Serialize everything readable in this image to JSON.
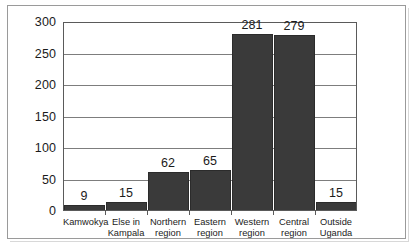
{
  "chart_data": {
    "type": "bar",
    "title": "",
    "subtitle": "",
    "xlabel": "",
    "ylabel": "",
    "categories": [
      "Kamwokya",
      "Else in\nKampala",
      "Northern\nregion",
      "Eastern\nregion",
      "Western\nregion",
      "Central\nregion",
      "Outside\nUganda"
    ],
    "values": [
      9,
      15,
      62,
      65,
      281,
      279,
      15
    ],
    "data_labels": [
      "9",
      "15",
      "62",
      "65",
      "281",
      "279",
      "15"
    ],
    "ylim": [
      0,
      300
    ],
    "ytick_values": [
      0,
      50,
      100,
      150,
      200,
      250,
      300
    ],
    "ytick_labels": [
      "0",
      "50",
      "100",
      "150",
      "200",
      "250",
      "300"
    ],
    "grid": "horizontal",
    "legend": "none",
    "bar_color": "#3a3a3a",
    "gridline_color": "#7d7d7d",
    "axis_color": "#5a5a5a",
    "text_color": "#1b1b1b",
    "background_color": "#ffffff",
    "frame_color": "#9a9a9a"
  }
}
